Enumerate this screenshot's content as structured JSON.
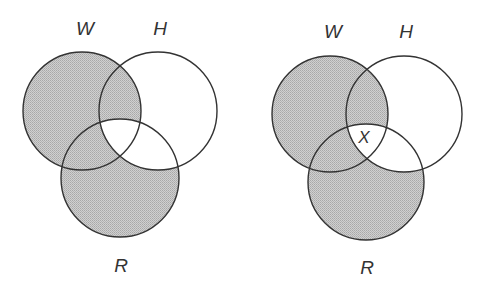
{
  "colors": {
    "shade": "#c2c2c2",
    "stroke": "#333333",
    "background": "#ffffff"
  },
  "diagrams": [
    {
      "name": "venn-left",
      "circles": {
        "W": {
          "label": "W",
          "cx": 82,
          "cy": 111,
          "r": 59,
          "label_x": 85,
          "label_y": 35
        },
        "H": {
          "label": "H",
          "cx": 158,
          "cy": 111,
          "r": 59,
          "label_x": 160,
          "label_y": 35
        },
        "R": {
          "label": "R",
          "cx": 120,
          "cy": 178,
          "r": 59,
          "label_x": 121,
          "label_y": 272
        }
      },
      "shaded_regions": [
        "W only",
        "R only",
        "W∩H not R",
        "W∩R not H"
      ],
      "unshaded_regions": [
        "H only",
        "H∩R not W",
        "W∩H∩R"
      ],
      "marker": null
    },
    {
      "name": "venn-right",
      "circles": {
        "W": {
          "label": "W",
          "cx": 330,
          "cy": 114,
          "r": 58,
          "label_x": 333,
          "label_y": 38
        },
        "H": {
          "label": "H",
          "cx": 404,
          "cy": 114,
          "r": 58,
          "label_x": 406,
          "label_y": 38
        },
        "R": {
          "label": "R",
          "cx": 366,
          "cy": 182,
          "r": 58,
          "label_x": 367,
          "label_y": 274
        }
      },
      "shaded_regions": [
        "W only",
        "R only",
        "W∩H not R",
        "W∩R not H"
      ],
      "unshaded_regions": [
        "H only",
        "H∩R not W",
        "W∩H∩R"
      ],
      "marker": {
        "text": "X",
        "region": "W∩H∩R",
        "x": 364,
        "y": 143
      }
    }
  ]
}
